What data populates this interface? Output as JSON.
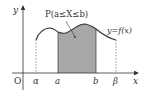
{
  "diagram": {
    "title_label": "P(a≤X≤b)",
    "curve_label": "y=f(x)",
    "axes": {
      "x_label": "x",
      "y_label": "y",
      "origin_label": "O"
    },
    "x_ticks": [
      {
        "label": "α",
        "x": 36
      },
      {
        "label": "a",
        "x": 58
      },
      {
        "label": "b",
        "x": 96
      },
      {
        "label": "β",
        "x": 116
      }
    ],
    "colors": {
      "curve": "#333333",
      "shade": "#a8a8a8",
      "axis": "#333333",
      "background": "#ffffff"
    }
  }
}
